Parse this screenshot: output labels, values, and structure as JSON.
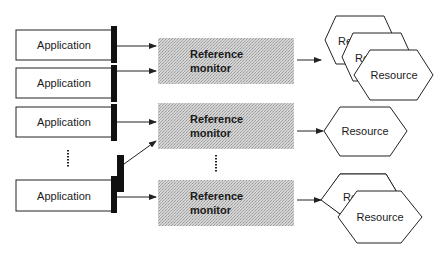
{
  "diagram": {
    "applications": [
      {
        "label": "Application"
      },
      {
        "label": "Application"
      },
      {
        "label": "Application"
      },
      {
        "label": "Application"
      }
    ],
    "ellipsis_apps": "⋮",
    "reference_monitors": [
      {
        "line1": "Reference",
        "line2": "monitor"
      },
      {
        "line1": "Reference",
        "line2": "monitor"
      },
      {
        "line1": "Reference",
        "line2": "monitor"
      }
    ],
    "ellipsis_monitors": "⋮",
    "resources": {
      "group1": [
        "Re",
        "Re",
        "Resource"
      ],
      "group2": [
        "Resource"
      ],
      "group3": [
        "Re",
        "Resource"
      ]
    },
    "colors": {
      "monitor_fill": "#c8c8c8",
      "bar": "#111111",
      "stroke": "#222222"
    }
  }
}
